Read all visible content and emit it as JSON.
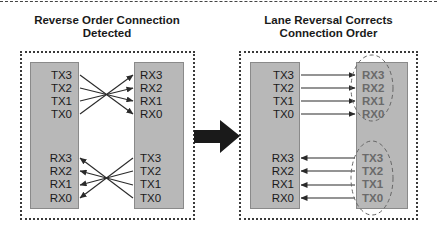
{
  "diagram": {
    "left_panel": {
      "title_line1": "Reverse Order Connection",
      "title_line2": "Detected",
      "device_a": {
        "top_labels": [
          "TX3",
          "TX2",
          "TX1",
          "TX0"
        ],
        "bottom_labels": [
          "RX3",
          "RX2",
          "RX1",
          "RX0"
        ]
      },
      "device_b": {
        "top_labels": [
          "RX3",
          "RX2",
          "RX1",
          "RX0"
        ],
        "bottom_labels": [
          "TX3",
          "TX2",
          "TX1",
          "TX0"
        ]
      },
      "connections": "crossed (TX3→RX0, TX2→RX1, TX1→RX2, TX0→RX3)"
    },
    "transition_arrow": "right-arrow",
    "right_panel": {
      "title_line1": "Lane Reversal Corrects",
      "title_line2": "Connection Order",
      "device_a": {
        "top_labels": [
          "TX3",
          "TX2",
          "TX1",
          "TX0"
        ],
        "bottom_labels": [
          "RX3",
          "RX2",
          "RX1",
          "RX0"
        ]
      },
      "device_b": {
        "top_labels": [
          "RX3",
          "RX2",
          "RX1",
          "RX0"
        ],
        "bottom_labels": [
          "TX3",
          "TX2",
          "TX1",
          "TX0"
        ],
        "highlight": "dashed ellipses around reversed lane groups"
      },
      "connections": "straight (TX3→RX3, TX2→RX2, TX1→RX1, TX0→RX0)"
    },
    "colors": {
      "chip_fill": "#b8b8b8",
      "line": "#2a2a2a",
      "dimmed_label": "#6a6a6a"
    }
  }
}
